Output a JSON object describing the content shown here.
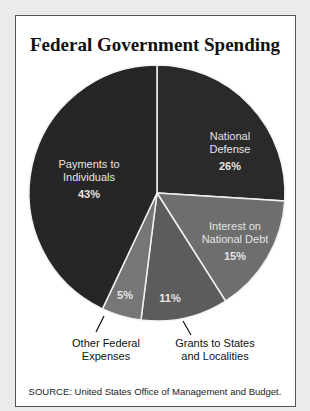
{
  "chart_data": {
    "type": "pie",
    "title": "Federal Government Spending",
    "source": "SOURCE: United States Office of Management and Budget.",
    "slices": [
      {
        "label": "National Defense",
        "value": 26,
        "display": "26%",
        "color": "#2a2a2a"
      },
      {
        "label": "Interest on National Debt",
        "value": 15,
        "display": "15%",
        "color": "#6e6e6e"
      },
      {
        "label": "Grants to States and Localities",
        "value": 11,
        "display": "11%",
        "color": "#5c5c5c"
      },
      {
        "label": "Other Federal Expenses",
        "value": 5,
        "display": "5%",
        "color": "#767676"
      },
      {
        "label": "Payments to Individuals",
        "value": 43,
        "display": "43%",
        "color": "#262626"
      }
    ]
  },
  "labels": {
    "defense": {
      "line1": "National",
      "line2": "Defense",
      "pct": "26%"
    },
    "interest": {
      "line1": "Interest on",
      "line2": "National Debt",
      "pct": "15%"
    },
    "grants": {
      "pct": "11%",
      "line1": "Grants to States",
      "line2": "and Localities"
    },
    "other": {
      "pct": "5%",
      "line1": "Other Federal",
      "line2": "Expenses"
    },
    "payments": {
      "line1": "Payments to",
      "line2": "Individuals",
      "pct": "43%"
    }
  }
}
